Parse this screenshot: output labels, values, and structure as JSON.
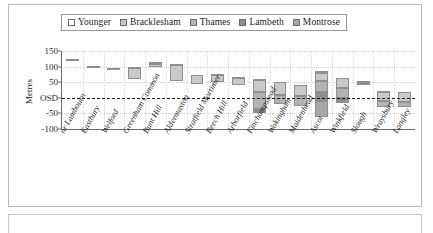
{
  "panel": {
    "name": "chart-panel"
  },
  "legend": {
    "position": "top-center",
    "entries": [
      {
        "label": "Younger",
        "color": "#ffffff",
        "icon": "legend-swatch"
      },
      {
        "label": "Bracklesham",
        "color": "#c9c9c9",
        "icon": "legend-swatch"
      },
      {
        "label": "Thames",
        "color": "#b3b3b3",
        "icon": "legend-swatch"
      },
      {
        "label": "Lambeth",
        "color": "#8e8e8e",
        "icon": "legend-swatch"
      },
      {
        "label": "Montrose",
        "color": "#a8a8a8",
        "icon": "legend-swatch"
      }
    ]
  },
  "chart_data": {
    "type": "bar",
    "title": "",
    "subtitle": "",
    "xlabel": "",
    "ylabel": "Metres",
    "ylim": [
      -100,
      150
    ],
    "yticks": [
      150,
      100,
      50,
      0,
      -50,
      -100
    ],
    "ytick_labels": [
      "150",
      "100",
      "50",
      "OSD",
      "-50",
      "-100"
    ],
    "grid": true,
    "stacked": true,
    "zero_reference_line": "OSD",
    "legend_position": "top-center",
    "categories": [
      "nr Lambourn",
      "Eastbury",
      "Welford",
      "Greenham Common",
      "Bunt Hill",
      "Aldermaston",
      "Stratfield Mortimer",
      "Beech Hill",
      "Arborfield",
      "Finchampstead",
      "Wokingham",
      "Maidenhead",
      "Ascot",
      "Winkfield",
      "Slough",
      "Wraysbury",
      "Langley"
    ],
    "series": [
      {
        "name": "Younger",
        "color": "#ffffff",
        "base": [
          118,
          100,
          92,
          95,
          108,
          105,
          72,
          72,
          62,
          58,
          50,
          40,
          80,
          62,
          48,
          20,
          18
        ],
        "values": [
          6,
          3,
          3,
          5,
          8,
          2,
          2,
          3,
          4,
          2,
          2,
          2,
          6,
          3,
          6,
          2,
          2
        ]
      },
      {
        "name": "Bracklesham",
        "color": "#c9c9c9",
        "base": [
          null,
          null,
          null,
          60,
          100,
          55,
          45,
          50,
          42,
          18,
          10,
          5,
          55,
          30,
          42,
          -10,
          -12
        ],
        "values": [
          null,
          null,
          null,
          35,
          8,
          50,
          27,
          22,
          20,
          40,
          40,
          35,
          25,
          32,
          6,
          30,
          30
        ]
      },
      {
        "name": "Thames",
        "color": "#b3b3b3",
        "base": [
          null,
          null,
          null,
          null,
          null,
          null,
          null,
          null,
          null,
          -35,
          -20,
          -25,
          20,
          0,
          null,
          -30,
          -28
        ],
        "values": [
          null,
          null,
          null,
          null,
          null,
          null,
          null,
          null,
          null,
          53,
          30,
          30,
          35,
          30,
          null,
          20,
          16
        ]
      },
      {
        "name": "Lambeth",
        "color": "#8e8e8e",
        "base": [
          null,
          null,
          null,
          null,
          null,
          null,
          null,
          null,
          null,
          -50,
          null,
          null,
          -10,
          -18,
          null,
          null,
          null
        ],
        "values": [
          null,
          null,
          null,
          null,
          null,
          null,
          null,
          null,
          null,
          15,
          null,
          null,
          30,
          18,
          null,
          null,
          null
        ]
      },
      {
        "name": "Montrose",
        "color": "#a8a8a8",
        "base": [
          null,
          null,
          null,
          null,
          null,
          null,
          null,
          null,
          null,
          null,
          null,
          null,
          -60,
          null,
          null,
          null,
          null
        ],
        "values": [
          null,
          null,
          null,
          null,
          null,
          null,
          null,
          null,
          null,
          null,
          null,
          null,
          50,
          null,
          null,
          null,
          null
        ]
      }
    ]
  }
}
